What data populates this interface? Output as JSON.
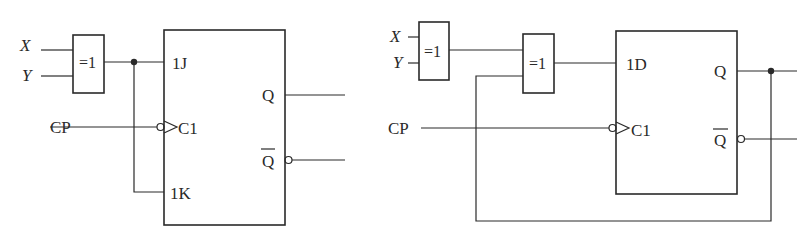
{
  "diagram": {
    "type": "logic-circuit",
    "circuits": [
      {
        "id": "a",
        "inputs": {
          "x": "X",
          "y": "Y",
          "clock": "CP"
        },
        "gate": {
          "label": "=1",
          "type": "XOR"
        },
        "flipflop": {
          "type": "JK",
          "pins": {
            "j": "1J",
            "k": "1K",
            "clk": "C1",
            "q": "Q",
            "qbar": "Q"
          }
        }
      },
      {
        "id": "b",
        "inputs": {
          "x": "X",
          "y": "Y",
          "clock": "CP"
        },
        "gate1": {
          "label": "=1",
          "type": "XOR"
        },
        "gate2": {
          "label": "=1",
          "type": "XOR"
        },
        "flipflop": {
          "type": "D",
          "pins": {
            "d": "1D",
            "clk": "C1",
            "q": "Q",
            "qbar": "Q"
          }
        },
        "feedback": "Q to XOR input"
      }
    ],
    "colors": {
      "ink": "#2a2a2a",
      "background": "#ffffff"
    }
  }
}
